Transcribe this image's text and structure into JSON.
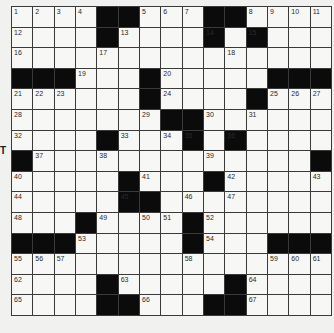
{
  "puzzle": {
    "rows": 15,
    "cols": 15,
    "layout": [
      "....##...##....",
      "....#....#.#...",
      "...............",
      "###...#.....###",
      "......#....#...",
      ".......##......",
      "....#...#.#....",
      "#.............#",
      ".....#...#.....",
      ".....##........",
      "...#....#......",
      "###.....#...###",
      "...............",
      "....#.....#....",
      "....##...##...."
    ],
    "numbers": [
      {
        "r": 0,
        "c": 0,
        "n": "1"
      },
      {
        "r": 0,
        "c": 1,
        "n": "2"
      },
      {
        "r": 0,
        "c": 2,
        "n": "3"
      },
      {
        "r": 0,
        "c": 3,
        "n": "4"
      },
      {
        "r": 0,
        "c": 6,
        "n": "5"
      },
      {
        "r": 0,
        "c": 7,
        "n": "6"
      },
      {
        "r": 0,
        "c": 8,
        "n": "7"
      },
      {
        "r": 0,
        "c": 11,
        "n": "8"
      },
      {
        "r": 0,
        "c": 12,
        "n": "9"
      },
      {
        "r": 0,
        "c": 13,
        "n": "10"
      },
      {
        "r": 0,
        "c": 14,
        "n": "11"
      },
      {
        "r": 1,
        "c": 0,
        "n": "12"
      },
      {
        "r": 1,
        "c": 5,
        "n": "13"
      },
      {
        "r": 1,
        "c": 9,
        "n": "14"
      },
      {
        "r": 1,
        "c": 11,
        "n": "15"
      },
      {
        "r": 2,
        "c": 0,
        "n": "16"
      },
      {
        "r": 2,
        "c": 4,
        "n": "17"
      },
      {
        "r": 2,
        "c": 10,
        "n": "18"
      },
      {
        "r": 3,
        "c": 3,
        "n": "19"
      },
      {
        "r": 3,
        "c": 7,
        "n": "20"
      },
      {
        "r": 4,
        "c": 0,
        "n": "21"
      },
      {
        "r": 4,
        "c": 1,
        "n": "22"
      },
      {
        "r": 4,
        "c": 2,
        "n": "23"
      },
      {
        "r": 4,
        "c": 7,
        "n": "24"
      },
      {
        "r": 4,
        "c": 12,
        "n": "25"
      },
      {
        "r": 4,
        "c": 13,
        "n": "26"
      },
      {
        "r": 4,
        "c": 14,
        "n": "27"
      },
      {
        "r": 5,
        "c": 0,
        "n": "28"
      },
      {
        "r": 5,
        "c": 6,
        "n": "29"
      },
      {
        "r": 5,
        "c": 9,
        "n": "30"
      },
      {
        "r": 5,
        "c": 11,
        "n": "31"
      },
      {
        "r": 6,
        "c": 0,
        "n": "32"
      },
      {
        "r": 6,
        "c": 5,
        "n": "33"
      },
      {
        "r": 6,
        "c": 7,
        "n": "34"
      },
      {
        "r": 6,
        "c": 8,
        "n": "35"
      },
      {
        "r": 6,
        "c": 10,
        "n": "36"
      },
      {
        "r": 7,
        "c": 1,
        "n": "37"
      },
      {
        "r": 7,
        "c": 4,
        "n": "38"
      },
      {
        "r": 7,
        "c": 9,
        "n": "39"
      },
      {
        "r": 8,
        "c": 0,
        "n": "40"
      },
      {
        "r": 8,
        "c": 6,
        "n": "41"
      },
      {
        "r": 8,
        "c": 10,
        "n": "42"
      },
      {
        "r": 8,
        "c": 14,
        "n": "43"
      },
      {
        "r": 9,
        "c": 0,
        "n": "44"
      },
      {
        "r": 9,
        "c": 5,
        "n": "45"
      },
      {
        "r": 9,
        "c": 8,
        "n": "46"
      },
      {
        "r": 9,
        "c": 10,
        "n": "47"
      },
      {
        "r": 10,
        "c": 0,
        "n": "48"
      },
      {
        "r": 10,
        "c": 4,
        "n": "49"
      },
      {
        "r": 10,
        "c": 6,
        "n": "50"
      },
      {
        "r": 10,
        "c": 7,
        "n": "51"
      },
      {
        "r": 10,
        "c": 9,
        "n": "52"
      },
      {
        "r": 11,
        "c": 3,
        "n": "53"
      },
      {
        "r": 11,
        "c": 9,
        "n": "54"
      },
      {
        "r": 12,
        "c": 0,
        "n": "55"
      },
      {
        "r": 12,
        "c": 1,
        "n": "56"
      },
      {
        "r": 12,
        "c": 2,
        "n": "57"
      },
      {
        "r": 12,
        "c": 8,
        "n": "58"
      },
      {
        "r": 12,
        "c": 12,
        "n": "59"
      },
      {
        "r": 12,
        "c": 13,
        "n": "60"
      },
      {
        "r": 12,
        "c": 14,
        "n": "61"
      },
      {
        "r": 13,
        "c": 0,
        "n": "62"
      },
      {
        "r": 13,
        "c": 5,
        "n": "63"
      },
      {
        "r": 13,
        "c": 11,
        "n": "64"
      },
      {
        "r": 14,
        "c": 0,
        "n": "65"
      },
      {
        "r": 14,
        "c": 6,
        "n": "66"
      },
      {
        "r": 14,
        "c": 11,
        "n": "67"
      }
    ]
  },
  "edge_text": "T"
}
